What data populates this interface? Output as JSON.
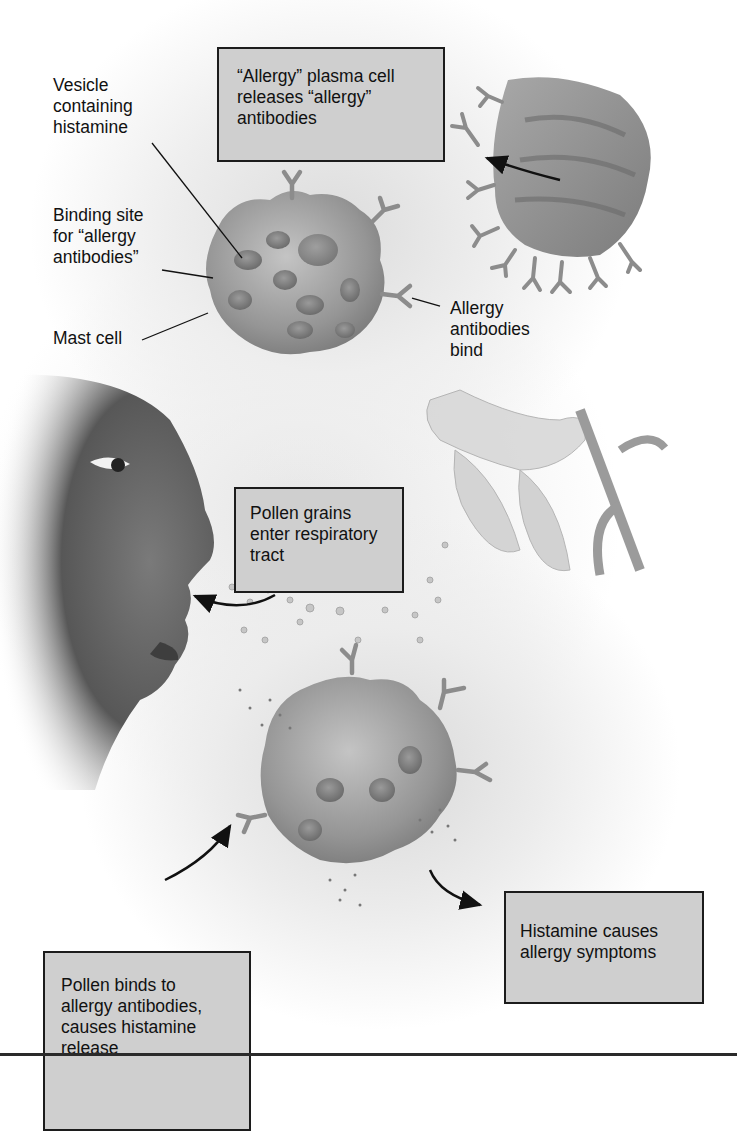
{
  "diagram": {
    "labels": {
      "vesicle": "Vesicle\ncontaining\nhistamine",
      "binding_site": "Binding site\nfor “allergy\nantibodies”",
      "mast_cell": "Mast cell",
      "antibodies_bind": "Allergy\nantibodies\nbind"
    },
    "boxes": {
      "plasma_cell": "“Allergy” plasma cell\nreleases “allergy”\nantibodies",
      "pollen_enter": "Pollen grains\nenter respiratory\ntract",
      "histamine_symptoms": "Histamine causes\nallergy symptoms",
      "pollen_binds": "Pollen binds to\nallergy antibodies,\ncauses histamine\nrelease"
    },
    "illustrations": [
      "plasma-cell",
      "mast-cell-sensitized",
      "face-profile",
      "lily-flower",
      "pollen-grains",
      "mast-cell-degranulating"
    ],
    "colors": {
      "box_fill": "#cfcfcf",
      "box_border": "#1c1c1c",
      "cell_fill": "#9a9a9a",
      "antibody": "#8c8c8c"
    }
  }
}
